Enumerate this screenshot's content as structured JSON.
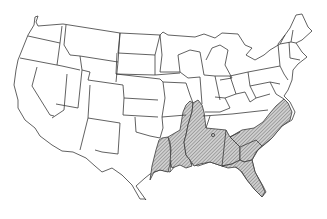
{
  "map": {
    "title": "Contiguous United States",
    "highlight_pattern": "diagonal-hatch",
    "colors": {
      "outline": "#3a3a3a",
      "background": "#ffffff",
      "hatch_fill": "#c8c8c8",
      "hatch_line": "#555555"
    },
    "highlighted_region": {
      "description": "Southeastern United States (hatched)",
      "states": [
        "East Texas",
        "Louisiana",
        "East Arkansas",
        "West Tennessee",
        "Mississippi",
        "Alabama",
        "Georgia",
        "Florida",
        "South Carolina",
        "Eastern North Carolina"
      ],
      "isolated_point": "small circle in northern Alabama/Georgia area"
    }
  }
}
